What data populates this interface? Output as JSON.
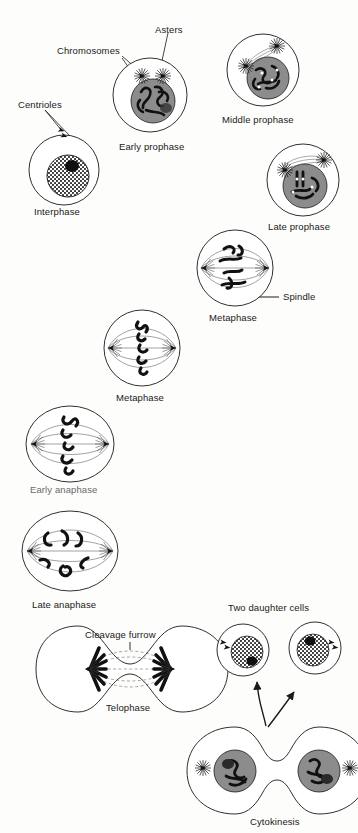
{
  "figure": {
    "background_color": "#fdfdfb",
    "ink_color": "#1a1a1a",
    "nucleus_gray": "#8c8c8c",
    "stipple_gray": "#b5b5b5"
  },
  "callouts": [
    {
      "id": "asters",
      "text": "Asters",
      "x": 155,
      "y": 30,
      "anchor": "start"
    },
    {
      "id": "chromosomes",
      "text": "Chromosomes",
      "x": 57,
      "y": 51,
      "anchor": "start"
    },
    {
      "id": "centrioles",
      "text": "Centrioles",
      "x": 18,
      "y": 105,
      "anchor": "start"
    },
    {
      "id": "spindle",
      "text": "Spindle",
      "x": 283,
      "y": 296,
      "anchor": "start"
    },
    {
      "id": "cleavage",
      "text": "Cleavage furrow",
      "x": 85,
      "y": 635,
      "anchor": "start"
    },
    {
      "id": "daughter",
      "text": "Two daughter cells",
      "x": 228,
      "y": 608,
      "anchor": "start"
    }
  ],
  "stages": [
    {
      "id": "interphase",
      "label": "Interphase",
      "cx": 64,
      "cy": 170,
      "r": 35,
      "label_x": 64,
      "label_y": 212,
      "faint": false
    },
    {
      "id": "early-prophase",
      "label": "Early prophase",
      "cx": 150,
      "cy": 95,
      "r": 37,
      "label_x": 153,
      "label_y": 147,
      "faint": false
    },
    {
      "id": "middle-prophase",
      "label": "Middle prophase",
      "cx": 263,
      "cy": 70,
      "r": 36,
      "label_x": 263,
      "label_y": 120,
      "faint": false
    },
    {
      "id": "late-prophase",
      "label": "Late prophase",
      "cx": 303,
      "cy": 180,
      "r": 36,
      "label_x": 305,
      "label_y": 227,
      "faint": false
    },
    {
      "id": "metaphase-upper",
      "label": "Metaphase",
      "cx": 235,
      "cy": 268,
      "r": 38,
      "label_x": 235,
      "label_y": 318,
      "faint": false
    },
    {
      "id": "metaphase-lower",
      "label": "Metaphase",
      "cx": 142,
      "cy": 348,
      "r": 38,
      "label_x": 142,
      "label_y": 398,
      "faint": false
    },
    {
      "id": "early-anaphase",
      "label": "Early anaphase",
      "cx": 70,
      "cy": 444,
      "r": 40,
      "label_x": 70,
      "label_y": 490,
      "faint": true
    },
    {
      "id": "late-anaphase",
      "label": "Late anaphase",
      "cx": 70,
      "cy": 551,
      "r": 44,
      "label_x": 70,
      "label_y": 605,
      "faint": false
    },
    {
      "id": "telophase",
      "label": "Telophase",
      "cx": 130,
      "cy": 669,
      "r": 44,
      "label_x": 130,
      "label_y": 708,
      "faint": false
    },
    {
      "id": "cytokinesis",
      "label": "Cytokinesis",
      "cx": 277,
      "cy": 771,
      "r": 46,
      "label_x": 277,
      "label_y": 822,
      "faint": false
    },
    {
      "id": "daughter-left",
      "label": "",
      "cx": 243,
      "cy": 650,
      "r": 26,
      "label_x": 0,
      "label_y": 0,
      "faint": false
    },
    {
      "id": "daughter-right",
      "label": "",
      "cx": 315,
      "cy": 648,
      "r": 26,
      "label_x": 0,
      "label_y": 0,
      "faint": false
    }
  ]
}
